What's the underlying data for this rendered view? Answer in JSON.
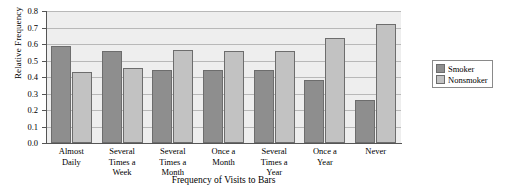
{
  "chart_data": {
    "type": "bar",
    "title": "",
    "xlabel": "Frequency of Visits to Bars",
    "ylabel": "Relative Frequency",
    "ylim": [
      0.0,
      0.8
    ],
    "ytick_labels": [
      "0.0",
      "0.1",
      "0.2",
      "0.3",
      "0.4",
      "0.5",
      "0.6",
      "0.7",
      "0.8"
    ],
    "ytick_values": [
      0.0,
      0.1,
      0.2,
      0.3,
      0.4,
      0.5,
      0.6,
      0.7,
      0.8
    ],
    "grid": true,
    "legend_position": "right",
    "categories": [
      "Almost\nDaily",
      "Several\nTimes a\nWeek",
      "Several\nTimes a\nMonth",
      "Once a\nMonth",
      "Several\nTimes a\nYear",
      "Once a\nYear",
      "Never"
    ],
    "series": [
      {
        "name": "Smoker",
        "color": "#8e8e8e",
        "values": [
          0.585,
          0.555,
          0.44,
          0.44,
          0.44,
          0.38,
          0.26
        ]
      },
      {
        "name": "Nonsmoker",
        "color": "#c2c2c2",
        "values": [
          0.43,
          0.455,
          0.565,
          0.555,
          0.56,
          0.635,
          0.72
        ]
      }
    ]
  },
  "legend": {
    "items": [
      {
        "label": "Smoker",
        "swatch_class": "smoker"
      },
      {
        "label": "Nonsmoker",
        "swatch_class": "nonsmoker"
      }
    ]
  }
}
